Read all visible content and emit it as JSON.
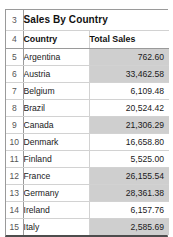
{
  "sheet": {
    "title_row": {
      "row_number": "3",
      "title": "Sales By Country"
    },
    "header_row": {
      "row_number": "4",
      "columns": [
        "Country",
        "Total Sales"
      ]
    },
    "rows": [
      {
        "row_number": "5",
        "country": "Argentina",
        "total_sales": "762.60",
        "shaded": true
      },
      {
        "row_number": "6",
        "country": "Austria",
        "total_sales": "33,462.58",
        "shaded": true
      },
      {
        "row_number": "7",
        "country": "Belgium",
        "total_sales": "6,109.48",
        "shaded": false
      },
      {
        "row_number": "8",
        "country": "Brazil",
        "total_sales": "20,524.42",
        "shaded": false
      },
      {
        "row_number": "9",
        "country": "Canada",
        "total_sales": "21,306.29",
        "shaded": true
      },
      {
        "row_number": "10",
        "country": "Denmark",
        "total_sales": "16,658.80",
        "shaded": false
      },
      {
        "row_number": "11",
        "country": "Finland",
        "total_sales": "5,525.00",
        "shaded": false
      },
      {
        "row_number": "12",
        "country": "France",
        "total_sales": "26,155.54",
        "shaded": true
      },
      {
        "row_number": "13",
        "country": "Germany",
        "total_sales": "28,361.38",
        "shaded": true
      },
      {
        "row_number": "14",
        "country": "Ireland",
        "total_sales": "6,157.76",
        "shaded": false
      },
      {
        "row_number": "15",
        "country": "Italy",
        "total_sales": "2,585.69",
        "shaded": true
      }
    ],
    "colors": {
      "shaded_fill": "#cfcfcf",
      "grid_line": "#d2d2d2",
      "outer_border": "#9a9a9a",
      "bottom_border": "#4d4d4d",
      "text": "#1a1a1a",
      "rownum_text": "#555555"
    }
  }
}
